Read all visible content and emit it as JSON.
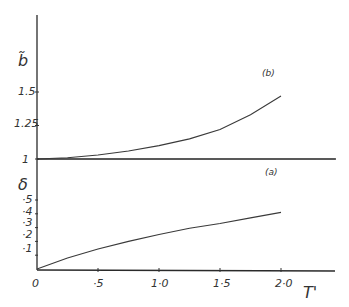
{
  "chart_data": {
    "type": "line",
    "title": "",
    "xlabel": "T'",
    "xlim": [
      0,
      2.4
    ],
    "x_ticks": [
      0,
      0.5,
      1.0,
      1.5,
      2.0
    ],
    "x_tick_labels": [
      "0",
      "·5",
      "1·0",
      "1·5",
      "2·0"
    ],
    "panels": [
      {
        "name": "upper",
        "ylabel": "b̃",
        "ylim": [
          1,
          1.8
        ],
        "y_ticks": [
          1,
          1.25,
          1.5
        ],
        "y_tick_labels": [
          "1",
          "1.25",
          "1.5"
        ],
        "series": [
          {
            "name": "(b)",
            "x": [
              0,
              0.25,
              0.5,
              0.75,
              1.0,
              1.25,
              1.5,
              1.75,
              2.0
            ],
            "values": [
              1.0,
              1.01,
              1.03,
              1.06,
              1.1,
              1.15,
              1.22,
              1.33,
              1.47
            ]
          },
          {
            "name": "reference y=1",
            "x": [
              0,
              2.45
            ],
            "values": [
              1.0,
              1.0
            ]
          }
        ]
      },
      {
        "name": "lower",
        "ylabel": "δ",
        "ylim": [
          0,
          0.6
        ],
        "y_ticks": [
          0.1,
          0.2,
          0.3,
          0.4,
          0.5
        ],
        "y_tick_labels": [
          "·1",
          "·2",
          "·3",
          "·4",
          "·5"
        ],
        "series": [
          {
            "name": "(a)",
            "x": [
              0,
              0.25,
              0.5,
              0.75,
              1.0,
              1.25,
              1.5,
              1.75,
              2.0
            ],
            "values": [
              0.0,
              0.08,
              0.145,
              0.2,
              0.25,
              0.295,
              0.33,
              0.37,
              0.41
            ]
          }
        ]
      }
    ],
    "annotations": [
      "(b)",
      "(a)"
    ],
    "grid": false,
    "legend": "none"
  },
  "labels": {
    "upper_ylabel": "b̃",
    "lower_ylabel": "δ",
    "xlabel": "T'",
    "curve_b": "(b)",
    "curve_a": "(a)",
    "upper_ticks": [
      "1",
      "1.25",
      "1.5"
    ],
    "lower_ticks": [
      "·1",
      "·2",
      "·3",
      "·4",
      "·5"
    ],
    "x_ticks": [
      "0",
      "·5",
      "1·0",
      "1·5",
      "2·0"
    ]
  }
}
